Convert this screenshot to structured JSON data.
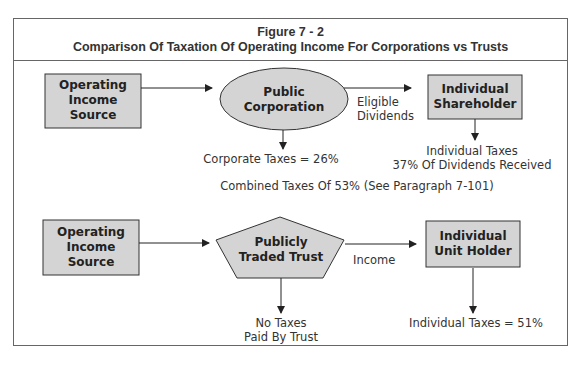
{
  "figure": {
    "number": "Figure 7 - 2",
    "title": "Comparison Of Taxation Of Operating Income For Corporations vs Trusts"
  },
  "corporation_flow": {
    "source": [
      "Operating",
      "Income",
      "Source"
    ],
    "entity": [
      "Public",
      "Corporation"
    ],
    "recipient": [
      "Individual",
      "Shareholder"
    ],
    "flow_label": [
      "Eligible",
      "Dividends"
    ],
    "entity_tax": "Corporate Taxes = 26%",
    "recipient_tax": [
      "Individual Taxes",
      "37% Of Dividends Received"
    ],
    "combined": "Combined Taxes Of 53% (See Paragraph 7-101)"
  },
  "trust_flow": {
    "source": [
      "Operating",
      "Income",
      "Source"
    ],
    "entity": [
      "Publicly",
      "Traded Trust"
    ],
    "recipient": [
      "Individual",
      "Unit Holder"
    ],
    "flow_label": "Income",
    "entity_tax": [
      "No Taxes",
      "Paid By Trust"
    ],
    "recipient_tax": "Individual Taxes = 51%"
  },
  "colors": {
    "shape_fill": "#d4d4d4",
    "stroke": "#333333",
    "frame": "#666666"
  }
}
